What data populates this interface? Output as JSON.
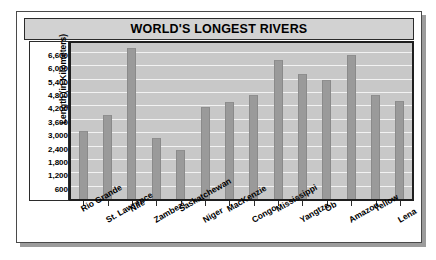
{
  "chart_data": {
    "type": "bar",
    "title": "WORLD'S LONGEST RIVERS",
    "xlabel": "",
    "ylabel": "Length (in Kilometers)",
    "ylim": [
      0,
      7000
    ],
    "grid": true,
    "legend": "none",
    "y_ticks": [
      "600",
      "1,200",
      "1,800",
      "2,400",
      "3,000",
      "3,600",
      "4,200",
      "4,800",
      "5,400",
      "6,000",
      "6,600"
    ],
    "y_tick_values": [
      600,
      1200,
      1800,
      2400,
      3000,
      3600,
      4200,
      4800,
      5400,
      6000,
      6600
    ],
    "categories": [
      "Rio Grande",
      "St. Lawrence",
      "Nile",
      "Zambezi",
      "Saskatchewan",
      "Niger",
      "MacKenzie",
      "Congo",
      "Mississippi",
      "Yangtze",
      "Ob",
      "Amazon",
      "Yellow",
      "Lena"
    ],
    "values": [
      3050,
      3750,
      6800,
      2750,
      2200,
      4150,
      4350,
      4650,
      6250,
      5600,
      5350,
      6450,
      4650,
      4400
    ],
    "series": [
      {
        "name": "Length",
        "values": [
          3050,
          3750,
          6800,
          2750,
          2200,
          4150,
          4350,
          4650,
          6250,
          5600,
          5350,
          6450,
          4650,
          4400
        ]
      }
    ],
    "colors": {
      "bar": "#9a9a9a",
      "plot_background": "#c8c8c8",
      "gridline": "#f2f2f2",
      "title_background": "#d2d2d2",
      "axis": "#1e1e1e",
      "text": "#000000",
      "card_background": "#ffffff",
      "shadow": "#9c9c9c"
    }
  }
}
